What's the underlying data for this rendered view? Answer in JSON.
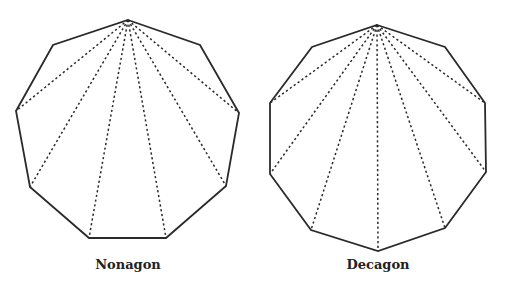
{
  "figures": [
    {
      "name": "Nonagon",
      "label": "Nonagon",
      "sides": 9,
      "vertices": [
        [
          128,
          20
        ],
        [
          200,
          45
        ],
        [
          239,
          113
        ],
        [
          226,
          186
        ],
        [
          166,
          238
        ],
        [
          89,
          238
        ],
        [
          30,
          187
        ],
        [
          16,
          111
        ],
        [
          53,
          45
        ]
      ],
      "diagonals_from_vertex": 0
    },
    {
      "name": "Decagon",
      "label": "Decagon",
      "sides": 10,
      "vertices": [
        [
          377,
          25
        ],
        [
          445,
          47
        ],
        [
          485,
          103
        ],
        [
          486,
          172
        ],
        [
          445,
          228
        ],
        [
          378,
          251
        ],
        [
          311,
          230
        ],
        [
          270,
          174
        ],
        [
          270,
          103
        ],
        [
          312,
          47
        ]
      ],
      "diagonals_from_vertex": 0
    }
  ],
  "colors": {
    "stroke": "#2a2a2a",
    "background": "#ffffff"
  }
}
